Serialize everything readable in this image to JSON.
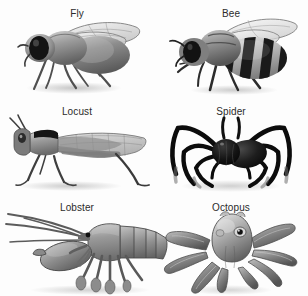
{
  "figure": {
    "background_color": "#fdfdfd",
    "label_color": "#2b2b2b",
    "layout": "2 columns x 3 rows grid of grayscale animal illustrations",
    "palette": {
      "ink": "#1c1c1c",
      "dark_gray": "#4a4a4a",
      "mid_gray": "#777777",
      "light_gray": "#a8a8a8",
      "pale_gray": "#cfcfcf",
      "highlight": "#e8e8e8",
      "shadow": "#bdbdbd"
    },
    "cells": [
      {
        "id": "fly",
        "label": "Fly",
        "row": 1,
        "col": 1,
        "icon": "fly-illustration"
      },
      {
        "id": "bee",
        "label": "Bee",
        "row": 1,
        "col": 2,
        "icon": "bee-illustration"
      },
      {
        "id": "locust",
        "label": "Locust",
        "row": 2,
        "col": 1,
        "icon": "locust-illustration"
      },
      {
        "id": "spider",
        "label": "Spider",
        "row": 2,
        "col": 2,
        "icon": "spider-illustration"
      },
      {
        "id": "lobster",
        "label": "Lobster",
        "row": 3,
        "col": 1,
        "icon": "lobster-illustration"
      },
      {
        "id": "octopus",
        "label": "Octopus",
        "row": 3,
        "col": 2,
        "icon": "octopus-illustration"
      }
    ]
  }
}
